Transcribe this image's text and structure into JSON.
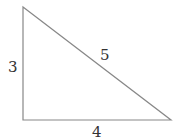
{
  "diagram": {
    "type": "right-triangle",
    "stroke_color": "#888888",
    "vertices": {
      "top": [
        23,
        7
      ],
      "right_angle": [
        23,
        120
      ],
      "right": [
        171,
        120
      ]
    },
    "labels": {
      "vertical_side": "3",
      "hypotenuse": "5",
      "horizontal_side": "4"
    }
  }
}
